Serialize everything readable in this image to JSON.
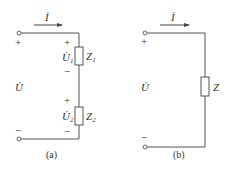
{
  "figures": [
    {
      "caption": "(a)",
      "current_label": "İ",
      "source_voltage_label": "U̇",
      "source_plus": "+",
      "source_minus": "−",
      "elements": [
        {
          "name": "Z",
          "subscript": "1",
          "voltage": "U̇",
          "voltage_subscript": "1",
          "plus": "+",
          "minus": "−"
        },
        {
          "name": "Z",
          "subscript": "2",
          "voltage": "U̇",
          "voltage_subscript": "2",
          "plus": "+",
          "minus": "−"
        }
      ]
    },
    {
      "caption": "(b)",
      "current_label": "İ",
      "source_voltage_label": "U̇",
      "source_plus": "+",
      "source_minus": "−",
      "elements": [
        {
          "name": "Z"
        }
      ]
    }
  ],
  "colors": {
    "wire": "#555555",
    "text": "#333333",
    "background": "#ffffff"
  }
}
